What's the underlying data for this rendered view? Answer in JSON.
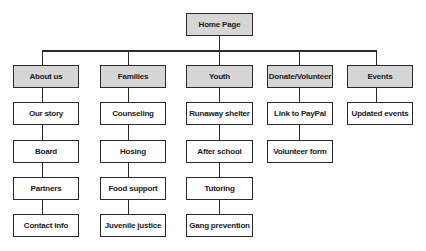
{
  "diagram": {
    "type": "sitemap",
    "root": {
      "label": "Home Page"
    },
    "sections": [
      {
        "label": "About us",
        "children": [
          "Our story",
          "Board",
          "Partners",
          "Contact info"
        ]
      },
      {
        "label": "Families",
        "children": [
          "Counseling",
          "Hosing",
          "Food support",
          "Juvenile justice"
        ]
      },
      {
        "label": "Youth",
        "children": [
          "Runaway shelter",
          "After school",
          "Tutoring",
          "Gang prevention"
        ]
      },
      {
        "label": "Donate/Volunteer",
        "children": [
          "Link to PayPal",
          "Volunteer form"
        ]
      },
      {
        "label": "Events",
        "children": [
          "Updated events"
        ]
      }
    ],
    "colors": {
      "header_fill": "#d6d6d6",
      "child_fill": "#ffffff",
      "stroke": "#2a2a2a"
    }
  }
}
